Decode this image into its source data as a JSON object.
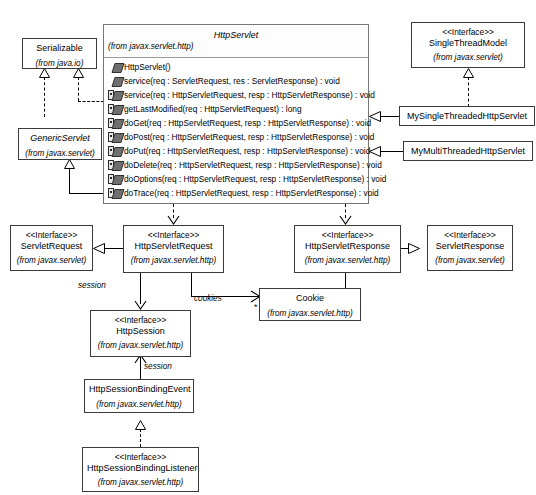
{
  "diagram": {
    "type": "uml-class-diagram"
  },
  "classes": {
    "serializable": {
      "name": "Serializable",
      "package": "(from java.io)"
    },
    "generic_servlet": {
      "name": "GenericServlet",
      "package": "(from javax.servlet)"
    },
    "http_servlet": {
      "name": "HttpServlet",
      "package": "(from javax.servlet.http)",
      "methods": [
        {
          "icon": "public-method-icon",
          "visibility": "public",
          "signature": "HttpServlet()"
        },
        {
          "icon": "public-method-icon",
          "visibility": "public",
          "signature": "service(req : ServletRequest, res : ServletResponse) : void"
        },
        {
          "icon": "protected-method-icon",
          "visibility": "protected",
          "signature": "service(req : HttpServletRequest, resp : HttpServletResponse) : void"
        },
        {
          "icon": "protected-method-icon",
          "visibility": "protected",
          "signature": "getLastModified(req : HttpServletRequest) : long"
        },
        {
          "icon": "protected-method-icon",
          "visibility": "protected",
          "signature": "doGet(req : HttpServletRequest, resp : HttpServletResponse) : void"
        },
        {
          "icon": "protected-method-icon",
          "visibility": "protected",
          "signature": "doPost(req : HttpServletRequest, resp : HttpServletResponse) : void"
        },
        {
          "icon": "protected-method-icon",
          "visibility": "protected",
          "signature": "doPut(req : HttpServletRequest, resp : HttpServletResponse) : void"
        },
        {
          "icon": "protected-method-icon",
          "visibility": "protected",
          "signature": "doDelete(req : HttpServletRequest, resp : HttpServletResponse) : void"
        },
        {
          "icon": "protected-method-icon",
          "visibility": "protected",
          "signature": "doOptions(req : HttpServletRequest, resp : HttpServletResponse) : void"
        },
        {
          "icon": "protected-method-icon",
          "visibility": "protected",
          "signature": "doTrace(req : HttpServletRequest, resp : HttpServletResponse) : void"
        }
      ]
    },
    "single_thread_model": {
      "stereotype": "<<Interface>>",
      "name": "SingleThreadModel",
      "package": "(from javax.servlet)"
    },
    "my_single_threaded": {
      "name": "MySingleThreadedHttpServlet"
    },
    "my_multi_threaded": {
      "name": "MyMultiThreadedHttpServlet"
    },
    "servlet_request": {
      "stereotype": "<<Interface>>",
      "name": "ServletRequest",
      "package": "(from javax.servlet)"
    },
    "http_servlet_request": {
      "stereotype": "<<Interface>>",
      "name": "HttpServletRequest",
      "package": "(from javax.servlet.http)"
    },
    "http_servlet_response": {
      "stereotype": "<<Interface>>",
      "name": "HttpServletResponse",
      "package": "(from javax.servlet.http)"
    },
    "servlet_response": {
      "stereotype": "<<Interface>>",
      "name": "ServletResponse",
      "package": "(from javax.servlet)"
    },
    "cookie": {
      "name": "Cookie",
      "package": "(from javax.servlet.http)"
    },
    "http_session": {
      "stereotype": "<<Interface>>",
      "name": "HttpSession",
      "package": "(from javax.servlet.http)"
    },
    "http_session_binding_event": {
      "name": "HttpSessionBindingEvent",
      "package": "(from javax.servlet.http)"
    },
    "http_session_binding_listener": {
      "stereotype": "<<Interface>>",
      "name": "HttpSessionBindingListener",
      "package": "(from javax.servlet.http)"
    }
  },
  "relationship_labels": {
    "session_from_request": "session",
    "session_from_binding_event": "session",
    "cookies_from_request": "cookies",
    "cookies_from_response": "cookies",
    "multiplicity_left": "*",
    "multiplicity_right": "*"
  },
  "colors": {
    "line": "#000000",
    "box_border": "#3a3a3a",
    "header_border": "#777777",
    "icon_fill": "#6f6f6f",
    "background": "#ffffff"
  }
}
